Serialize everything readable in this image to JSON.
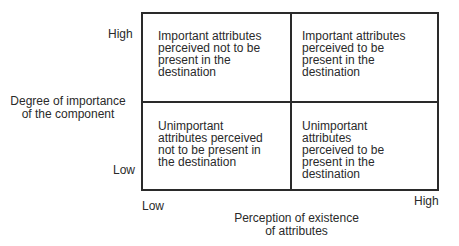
{
  "y_axis": {
    "title_line1": "Degree of importance",
    "title_line2": "of the component",
    "high": "High",
    "low": "Low"
  },
  "x_axis": {
    "title_line1": "Perception of existence",
    "title_line2": "of attributes",
    "low": "Low",
    "high": "High"
  },
  "quadrants": {
    "top_left": [
      "Important attributes",
      "perceived not to be",
      "present in the",
      "destination"
    ],
    "top_right": [
      "Important attributes",
      "perceived to be",
      "present in the",
      "destination"
    ],
    "bottom_left": [
      "Unimportant",
      "attributes perceived",
      "not to be present in",
      "the destination"
    ],
    "bottom_right": [
      "Unimportant",
      "attributes",
      "perceived to be",
      "present in the",
      "destination"
    ]
  }
}
